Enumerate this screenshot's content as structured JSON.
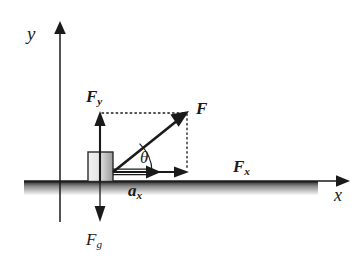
{
  "figure": {
    "kind": "free-body-force-diagram",
    "background_color": "#ffffff",
    "ink_color": "#1a1a1a"
  },
  "axes": {
    "y_label": "y",
    "x_label": "x",
    "origin": {
      "x": 60,
      "y": 181
    },
    "y_axis": {
      "x": 60,
      "top": 22,
      "bottom": 222,
      "arrow": "up"
    },
    "x_axis": {
      "y": 181,
      "left": 24,
      "right": 348,
      "arrow": "right"
    }
  },
  "ground": {
    "name": "ground-surface",
    "top_y": 181,
    "left": 24,
    "right": 318,
    "height": 14,
    "shading": "gradient-dark-to-light"
  },
  "block": {
    "name": "block",
    "x": 88,
    "y": 152,
    "width": 25,
    "height": 29,
    "fill": "gradient-light-to-gray",
    "stroke": "#2b2b2b"
  },
  "vectors": {
    "F": {
      "label": "F",
      "bold": true,
      "from": {
        "x": 113,
        "y": 172
      },
      "to": {
        "x": 187,
        "y": 113
      },
      "style": "solid-thick"
    },
    "Fx": {
      "label": "F",
      "subscript": "x",
      "bold": true,
      "from": {
        "x": 113,
        "y": 172
      },
      "to": {
        "x": 187,
        "y": 172
      },
      "style": "solid"
    },
    "Fy": {
      "label": "F",
      "subscript": "y",
      "bold": true,
      "from": {
        "x": 100,
        "y": 181
      },
      "to": {
        "x": 100,
        "y": 113
      },
      "style": "solid"
    },
    "Fg": {
      "label": "F",
      "subscript": "g",
      "bold": false,
      "from": {
        "x": 100,
        "y": 152
      },
      "to": {
        "x": 100,
        "y": 222
      },
      "style": "thin"
    },
    "ax": {
      "label": "a",
      "subscript": "x",
      "bold": true,
      "from": {
        "x": 113,
        "y": 172
      },
      "to": {
        "x": 160,
        "y": 172
      },
      "style": "double-line-hollow"
    }
  },
  "angle": {
    "label": "θ",
    "vertex": {
      "x": 113,
      "y": 172
    },
    "radius": 26,
    "between": [
      "Fx",
      "F"
    ]
  },
  "construction_lines": [
    {
      "name": "dotted-horizontal-from-Fy",
      "from": {
        "x": 101,
        "y": 113
      },
      "to": {
        "x": 187,
        "y": 113
      },
      "style": "dotted"
    },
    {
      "name": "dotted-vertical-to-Fx",
      "from": {
        "x": 187,
        "y": 113
      },
      "to": {
        "x": 187,
        "y": 172
      },
      "style": "dotted"
    }
  ]
}
